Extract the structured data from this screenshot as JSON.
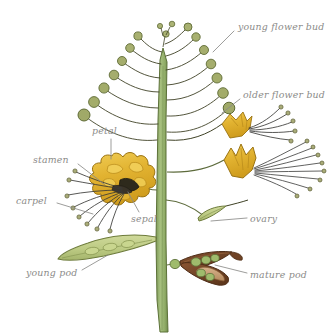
{
  "figure": {
    "background_color": "#ffffff",
    "width": 332,
    "height": 335
  },
  "palette": {
    "stem_fill": "#8aa861",
    "stem_fill_light": "#a3bd7a",
    "stem_outline": "#5d7239",
    "bud_fill": "#a8b070",
    "bud_outline": "#5f6b36",
    "petal_fill": "#e0b02e",
    "petal_fill_light": "#edc94f",
    "petal_outline": "#9a7312",
    "filament_color": "#3a3a38",
    "anther_fill": "#a9ac78",
    "anther_outline": "#5a5c34",
    "young_pod_fill": "#c3cf8e",
    "young_pod_outline": "#6e7c3c",
    "mature_pod_fill": "#7b4a2c",
    "mature_pod_fill_light": "#c9a177",
    "mature_pod_outline": "#4e2d17",
    "seed_fill": "#9fbb6c",
    "seed_outline": "#5d7239",
    "label_color": "#8b8b89",
    "leader_color": "#8b8b89"
  },
  "labels": [
    {
      "id": "young-flower-bud",
      "text": "young flower bud",
      "side": "right",
      "x": 238,
      "y": 22,
      "leader": {
        "x1": 234,
        "y1": 31,
        "x2": 213,
        "y2": 52
      }
    },
    {
      "id": "older-flower-bud",
      "text": "older flower bud",
      "side": "right",
      "x": 243,
      "y": 90,
      "leader": {
        "x1": 240,
        "y1": 99,
        "x2": 222,
        "y2": 113
      }
    },
    {
      "id": "petal",
      "text": "petal",
      "side": "left",
      "x": 92,
      "y": 126,
      "leader": {
        "x1": 111,
        "y1": 139,
        "x2": 111,
        "y2": 159
      }
    },
    {
      "id": "stamen",
      "text": "stamen",
      "side": "left",
      "x": 33,
      "y": 155,
      "leader": {
        "x1": 78,
        "y1": 164,
        "x2": 104,
        "y2": 184
      }
    },
    {
      "id": "carpel",
      "text": "carpel",
      "side": "left",
      "x": 16,
      "y": 196,
      "leader": {
        "x1": 57,
        "y1": 203,
        "x2": 93,
        "y2": 214
      }
    },
    {
      "id": "sepal",
      "text": "sepal",
      "side": "left",
      "x": 131,
      "y": 214,
      "leader": {
        "x1": 139,
        "y1": 212,
        "x2": 128,
        "y2": 192
      }
    },
    {
      "id": "ovary",
      "text": "ovary",
      "side": "right",
      "x": 250,
      "y": 214,
      "leader": {
        "x1": 247,
        "y1": 218,
        "x2": 211,
        "y2": 221
      }
    },
    {
      "id": "young-pod",
      "text": "young pod",
      "side": "left",
      "x": 26,
      "y": 268,
      "leader": {
        "x1": 82,
        "y1": 270,
        "x2": 108,
        "y2": 255
      }
    },
    {
      "id": "mature-pod",
      "text": "mature pod",
      "side": "right",
      "x": 250,
      "y": 270,
      "leader": {
        "x1": 247,
        "y1": 273,
        "x2": 215,
        "y2": 265
      }
    }
  ],
  "parts": {
    "stem_label": "main stem",
    "young_buds_count": 14,
    "older_buds_count": 2,
    "flowers_count": 3,
    "young_pods_count": 1,
    "mature_pods_count": 1,
    "ovary_count": 1
  }
}
